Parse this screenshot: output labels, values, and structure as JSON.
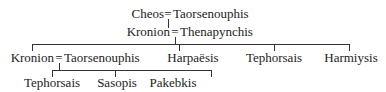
{
  "diagram": {
    "type": "genealogy-tree",
    "marriage_symbol": "=",
    "generations": [
      {
        "couples": [
          {
            "id": "g1",
            "partner1": "Cheos",
            "partner2": "Taorsenouphis"
          }
        ]
      },
      {
        "couples": [
          {
            "id": "g2",
            "partner1": "Kronion",
            "partner2": "Thenapynchis",
            "parent_couple": "g1"
          }
        ]
      },
      {
        "couples": [
          {
            "id": "g3",
            "partner1": "Kronion",
            "partner2": "Taorsenouphis",
            "parent_couple": "g2"
          }
        ],
        "individuals": [
          {
            "name": "Harpaësis",
            "parent_couple": "g2"
          },
          {
            "name": "Tephorsais",
            "parent_couple": "g2"
          },
          {
            "name": "Harmiysis",
            "parent_couple": "g2"
          }
        ]
      },
      {
        "individuals": [
          {
            "name": "Tephorsais",
            "parent_couple": "g3"
          },
          {
            "name": "Sasopis",
            "parent_couple": "g3"
          },
          {
            "name": "Pakebkis",
            "parent_couple": "g3"
          }
        ]
      }
    ]
  }
}
